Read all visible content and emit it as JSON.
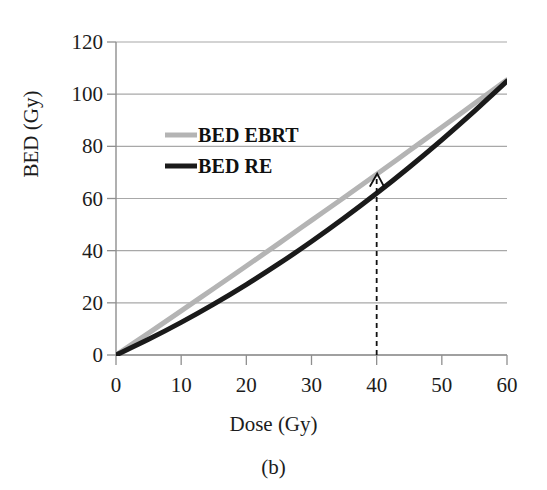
{
  "chart_data": {
    "type": "line",
    "title": "",
    "subtitle": "",
    "caption": "(b)",
    "xlabel": "Dose (Gy)",
    "ylabel": "BED (Gy)",
    "xlim": [
      0,
      60
    ],
    "ylim": [
      0,
      120
    ],
    "xticks": [
      0,
      10,
      20,
      30,
      40,
      50,
      60
    ],
    "yticks": [
      0,
      20,
      40,
      60,
      80,
      100,
      120
    ],
    "xtick_labels": [
      "0",
      "10",
      "20",
      "30",
      "40",
      "50",
      "60"
    ],
    "ytick_labels": [
      "0",
      "20",
      "40",
      "60",
      "80",
      "100",
      "120"
    ],
    "grid": "horizontal",
    "legend_position": "upper-left-inside",
    "series": [
      {
        "name": "BED EBRT",
        "color": "#b4b4b4",
        "line_width": 5,
        "x": [
          0,
          5,
          10,
          15,
          20,
          25,
          30,
          35,
          40,
          45,
          50,
          55,
          60
        ],
        "values": [
          0,
          8.4,
          16.9,
          25.5,
          34.1,
          42.8,
          51.6,
          60.4,
          69.3,
          78.3,
          87.3,
          96.4,
          105.5
        ]
      },
      {
        "name": "BED RE",
        "color": "#1a1a1a",
        "line_width": 5,
        "x": [
          0,
          5,
          10,
          15,
          20,
          25,
          30,
          35,
          40,
          45,
          50,
          55,
          58,
          60
        ],
        "values": [
          0,
          6.0,
          12.5,
          19.5,
          27.0,
          35.0,
          43.5,
          52.5,
          62.0,
          72.0,
          82.5,
          93.5,
          100.4,
          105.0
        ]
      }
    ],
    "annotations": [
      {
        "type": "arrow",
        "style": "dashed-vertical-arrow",
        "x": 40,
        "y_from": 0,
        "y_to": 69,
        "label": "",
        "color": "#111111",
        "note": "dashed vertical line at Dose = 40 Gy pointing up to the curve crossing at BED ~ 69 Gy"
      }
    ]
  },
  "legend": {
    "items": [
      {
        "label": "BED EBRT",
        "swatch": "gray-line-swatch"
      },
      {
        "label": "BED RE",
        "swatch": "black-line-swatch"
      }
    ]
  },
  "axes": {
    "x_title": "Dose (Gy)",
    "y_title": "BED (Gy)"
  },
  "caption": {
    "text": "(b)"
  },
  "colors": {
    "ebrt": "#b4b4b4",
    "re": "#1a1a1a",
    "grid": "#a8a8a8",
    "axis": "#8f8f8f",
    "text": "#1c1c1c",
    "background": "#ffffff"
  }
}
